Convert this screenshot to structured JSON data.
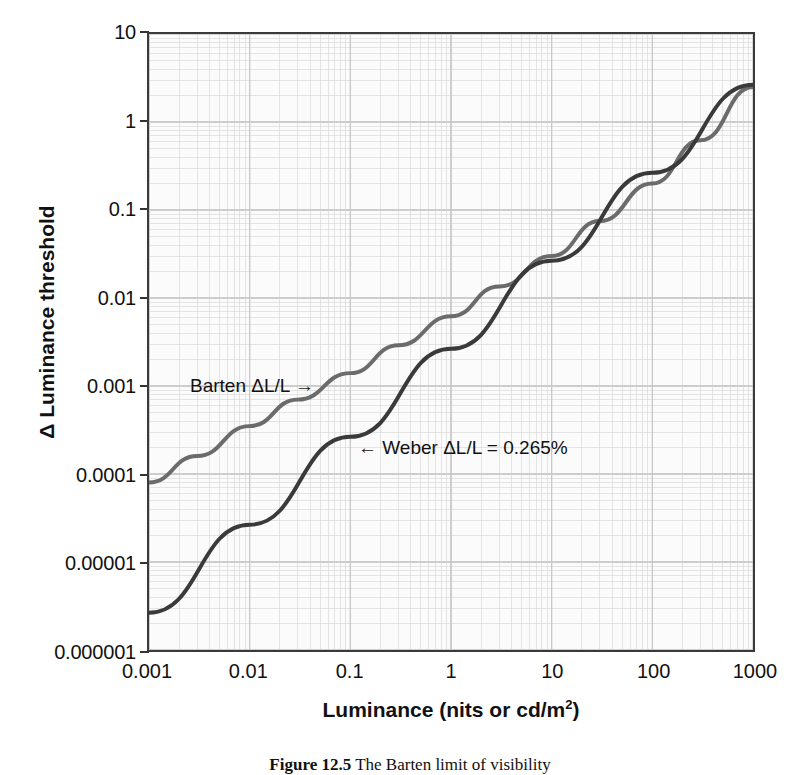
{
  "figure": {
    "caption_label": "Figure 12.5",
    "caption_text": "The Barten limit of visibility",
    "background_color": "#ffffff",
    "plot_background_color": "#fbfbfb",
    "grid_color": "#d9d9d9",
    "frame_color": "#3a3a3a"
  },
  "annotations": {
    "barten": "Barten ΔL/L →",
    "weber": "← Weber ΔL/L = 0.265%"
  },
  "axes": {
    "x_title_main": "Luminance (nits or cd/m",
    "x_title_sup": "2",
    "x_title_close": ")",
    "y_title": "Δ Luminance threshold"
  },
  "chart_data": {
    "type": "line",
    "title": "",
    "xlabel": "Luminance (nits or cd/m2)",
    "ylabel": "Δ Luminance threshold",
    "xscale": "log",
    "yscale": "log",
    "xlim": [
      0.001,
      1000
    ],
    "ylim": [
      1e-06,
      10
    ],
    "grid": true,
    "minor_grid": true,
    "legend": "inline-annotations",
    "xticks": [
      "0.001",
      "0.01",
      "0.1",
      "1",
      "10",
      "100",
      "1000"
    ],
    "xtick_values": [
      0.001,
      0.01,
      0.1,
      1,
      10,
      100,
      1000
    ],
    "yticks": [
      "10",
      "1",
      "0.1",
      "0.01",
      "0.001",
      "0.0001",
      "0.00001",
      "0.000001"
    ],
    "ytick_values": [
      10,
      1,
      0.1,
      0.01,
      0.001,
      0.0001,
      1e-05,
      1e-06
    ],
    "series": [
      {
        "name": "Barten ΔL/L",
        "color": "#6b6b6b",
        "width": 4,
        "x": [
          0.001,
          0.003,
          0.01,
          0.03,
          0.1,
          0.3,
          1,
          3,
          10,
          30,
          100,
          300,
          1000
        ],
        "y": [
          8e-05,
          0.00016,
          0.00035,
          0.0007,
          0.0014,
          0.0029,
          0.0062,
          0.0135,
          0.03,
          0.075,
          0.2,
          0.62,
          2.5
        ]
      },
      {
        "name": "Weber ΔL/L = 0.265%",
        "color": "#3a3a3a",
        "width": 4,
        "x": [
          0.001,
          0.01,
          0.1,
          1,
          10,
          100,
          1000
        ],
        "y": [
          2.65e-06,
          2.65e-05,
          0.000265,
          0.00265,
          0.0265,
          0.265,
          2.65
        ]
      }
    ]
  }
}
